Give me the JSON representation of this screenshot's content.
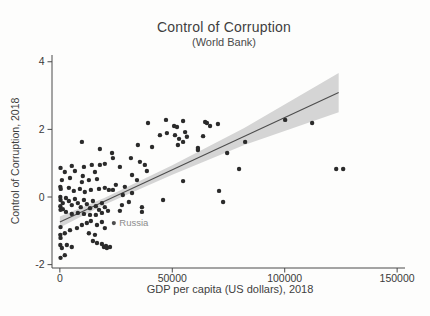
{
  "figure": {
    "title": "Control of Corruption",
    "subtitle": "(World Bank)",
    "xlabel": "GDP per capita (US dollars), 2018",
    "ylabel": "Control of Corruption, 2018"
  },
  "chart_data": {
    "type": "scatter",
    "title": "Control of Corruption",
    "subtitle": "(World Bank)",
    "xlabel": "GDP per capita (US dollars), 2018",
    "ylabel": "Control of Corruption, 2018",
    "xlim": [
      -3500,
      153500
    ],
    "ylim": [
      -2.1,
      4.2
    ],
    "x_ticks": [
      0,
      50000,
      100000,
      150000
    ],
    "y_ticks": [
      -2,
      0,
      2,
      4
    ],
    "grid": false,
    "legend": "none",
    "point_color": "#2b2b2b",
    "axis_color": "#4a4a4a",
    "tick_label_color": "#3a3a3a",
    "band_color": "#d5d5d5",
    "line_color": "#4d4d4d",
    "annotation": {
      "label": "Russia",
      "x": 24000,
      "y": -0.77,
      "color": "#8c8c8c"
    },
    "fit_line": {
      "x": [
        0,
        124000
      ],
      "y": [
        -0.74,
        3.09
      ]
    },
    "confidence_band": {
      "x": [
        0,
        20000,
        50000,
        82000,
        124000
      ],
      "upper": [
        -0.58,
        -0.02,
        0.94,
        2.04,
        3.67
      ],
      "lower": [
        -0.9,
        -0.22,
        0.66,
        1.54,
        2.51
      ]
    },
    "points": [
      [
        9800,
        1.63
      ],
      [
        17800,
        1.42
      ],
      [
        23200,
        1.3
      ],
      [
        34700,
        1.54
      ],
      [
        39200,
        2.19
      ],
      [
        41000,
        1.48
      ],
      [
        44500,
        1.83
      ],
      [
        47200,
        2.28
      ],
      [
        47600,
        1.89
      ],
      [
        50800,
        2.1
      ],
      [
        51200,
        1.83
      ],
      [
        52500,
        1.54
      ],
      [
        53000,
        1.72
      ],
      [
        52100,
        2.07
      ],
      [
        54800,
        2.25
      ],
      [
        55700,
        1.92
      ],
      [
        56500,
        1.78
      ],
      [
        54800,
        1.63
      ],
      [
        61400,
        1.45
      ],
      [
        63700,
        1.8
      ],
      [
        64600,
        2.22
      ],
      [
        65400,
        2.19
      ],
      [
        66800,
        2.1
      ],
      [
        70300,
        2.16
      ],
      [
        82400,
        1.63
      ],
      [
        100200,
        2.28
      ],
      [
        112200,
        2.19
      ],
      [
        61400,
        1.39
      ],
      [
        74400,
        1.3
      ],
      [
        79700,
        0.83
      ],
      [
        70800,
        0.18
      ],
      [
        72600,
        -0.15
      ],
      [
        54800,
        0.47
      ],
      [
        122900,
        0.83
      ],
      [
        126000,
        0.83
      ],
      [
        23600,
        1.15
      ],
      [
        31600,
        1.15
      ],
      [
        35600,
        1.04
      ],
      [
        26700,
        0.89
      ],
      [
        37800,
        0.95
      ],
      [
        38700,
        0.77
      ],
      [
        32100,
        0.65
      ],
      [
        34300,
        0.5
      ],
      [
        24900,
        0.36
      ],
      [
        28900,
        0.3
      ],
      [
        23600,
        0.21
      ],
      [
        28000,
        0.06
      ],
      [
        32100,
        0.12
      ],
      [
        30700,
        -0.15
      ],
      [
        27600,
        -0.24
      ],
      [
        36500,
        -0.3
      ],
      [
        45900,
        -0.09
      ],
      [
        26700,
        -0.41
      ],
      [
        36500,
        -0.44
      ],
      [
        300,
        0.86
      ],
      [
        2200,
        0.74
      ],
      [
        5300,
        0.92
      ],
      [
        6700,
        0.77
      ],
      [
        10700,
        0.89
      ],
      [
        10200,
        0.62
      ],
      [
        14200,
        0.95
      ],
      [
        15600,
        0.74
      ],
      [
        17800,
        0.95
      ],
      [
        20000,
        0.98
      ],
      [
        900,
        0.5
      ],
      [
        4500,
        0.56
      ],
      [
        9800,
        0.44
      ],
      [
        12900,
        0.5
      ],
      [
        16500,
        0.53
      ],
      [
        200,
        0.3
      ],
      [
        400,
        0.24
      ],
      [
        4000,
        0.27
      ],
      [
        6200,
        0.18
      ],
      [
        8900,
        0.24
      ],
      [
        11100,
        0.15
      ],
      [
        13800,
        0.21
      ],
      [
        17400,
        0.24
      ],
      [
        20000,
        0.27
      ],
      [
        21800,
        0.21
      ],
      [
        200,
        0.0
      ],
      [
        300,
        -0.09
      ],
      [
        1300,
        -0.18
      ],
      [
        2700,
        -0.03
      ],
      [
        4000,
        -0.12
      ],
      [
        5300,
        -0.24
      ],
      [
        6700,
        -0.06
      ],
      [
        8000,
        -0.18
      ],
      [
        9300,
        -0.3
      ],
      [
        10700,
        -0.09
      ],
      [
        12000,
        -0.21
      ],
      [
        13400,
        -0.33
      ],
      [
        14700,
        -0.12
      ],
      [
        16000,
        -0.27
      ],
      [
        17400,
        -0.38
      ],
      [
        18700,
        -0.18
      ],
      [
        20000,
        -0.3
      ],
      [
        21400,
        -0.41
      ],
      [
        300,
        -0.38
      ],
      [
        2700,
        -0.44
      ],
      [
        5300,
        -0.5
      ],
      [
        8000,
        -0.47
      ],
      [
        10700,
        -0.5
      ],
      [
        13400,
        -0.53
      ],
      [
        200,
        -0.27
      ],
      [
        1300,
        -0.36
      ],
      [
        16000,
        -0.53
      ],
      [
        18700,
        -0.47
      ],
      [
        300,
        -0.89
      ],
      [
        200,
        -1.12
      ],
      [
        300,
        -1.21
      ],
      [
        2200,
        -1.07
      ],
      [
        4500,
        -0.98
      ],
      [
        7600,
        -0.92
      ],
      [
        9800,
        -0.83
      ],
      [
        12000,
        -0.77
      ],
      [
        13800,
        -0.71
      ],
      [
        16500,
        -0.83
      ],
      [
        18700,
        -0.74
      ],
      [
        20000,
        -0.92
      ],
      [
        12900,
        -1.07
      ],
      [
        15600,
        -1.12
      ],
      [
        200,
        -1.42
      ],
      [
        900,
        -1.51
      ],
      [
        3100,
        -1.42
      ],
      [
        5300,
        -1.48
      ],
      [
        2200,
        -1.72
      ],
      [
        300,
        -1.8
      ],
      [
        16500,
        -1.36
      ],
      [
        19600,
        -1.48
      ],
      [
        20900,
        -1.51
      ],
      [
        14700,
        -1.3
      ],
      [
        18700,
        -1.39
      ],
      [
        20500,
        -1.45
      ],
      [
        22300,
        -1.48
      ]
    ]
  }
}
